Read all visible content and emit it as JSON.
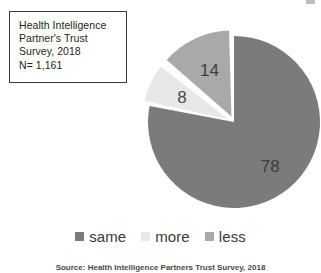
{
  "annotation": {
    "lines": [
      "Health Intelligence",
      "Partner's Trust",
      "Survey, 2018",
      "N= 1,161"
    ]
  },
  "legend": {
    "items": [
      {
        "label": "same",
        "color": "#7b7b7b"
      },
      {
        "label": "more",
        "color": "#e8e8e8"
      },
      {
        "label": "less",
        "color": "#a9a9a9"
      }
    ]
  },
  "source": {
    "text": "Source: Health Intelligence Partners Trust Survey, 2018"
  },
  "chart_data": {
    "type": "pie",
    "title": "",
    "labels": [
      "same",
      "more",
      "less"
    ],
    "values": [
      78,
      8,
      14
    ],
    "value_labels": [
      "78",
      "8",
      "14"
    ],
    "units": "percent",
    "colors": [
      "#7b7b7b",
      "#e8e8e8",
      "#a9a9a9"
    ],
    "legend_position": "bottom",
    "start_angle_deg": 0,
    "direction": "clockwise",
    "exploded_slices": [
      "more",
      "less"
    ],
    "slice_gap": "white",
    "annotations": [
      "Health Intelligence Partner's Trust Survey, 2018",
      "N= 1,161"
    ]
  }
}
